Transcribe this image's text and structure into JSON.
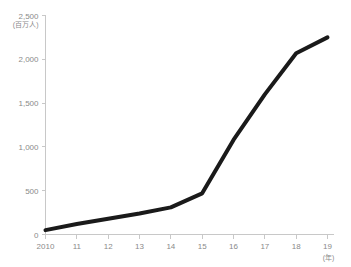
{
  "chart_data": {
    "type": "line",
    "title": "",
    "xlabel": "(年)",
    "ylabel": "(百万人)",
    "categories": [
      "2010",
      "11",
      "12",
      "13",
      "14",
      "15",
      "16",
      "17",
      "18",
      "19"
    ],
    "x": [
      2010,
      2011,
      2012,
      2013,
      2014,
      2015,
      2016,
      2017,
      2018,
      2019
    ],
    "values": [
      50,
      120,
      180,
      240,
      310,
      470,
      1080,
      1600,
      2070,
      2250
    ],
    "series": [
      {
        "name": "",
        "values": [
          50,
          120,
          180,
          240,
          310,
          470,
          1080,
          1600,
          2070,
          2250
        ]
      }
    ],
    "ylim": [
      0,
      2500
    ],
    "ytick_values": [
      0,
      500,
      1000,
      1500,
      2000,
      2500
    ],
    "ytick_labels": [
      "0",
      "500",
      "1,000",
      "1,500",
      "2,000",
      "2,500"
    ],
    "grid": false,
    "legend": "none",
    "line_color": "#1a1a1a",
    "axis_color": "#c8c8c8",
    "label_color": "#8a8a8a"
  }
}
